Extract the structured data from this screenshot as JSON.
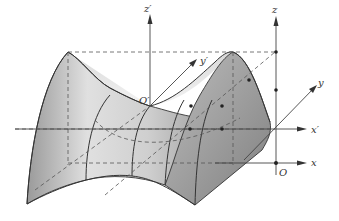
{
  "diagram": {
    "type": "saddle-surface-coordinate-translation",
    "labels": {
      "z_prime": "z′",
      "y_prime": "y′",
      "x_prime": "x′",
      "o_prime": "O′",
      "z": "z",
      "y": "y",
      "x": "x",
      "o": "O"
    },
    "colors": {
      "surface_light": "#f2f2f2",
      "surface_dark": "#8a8a8a",
      "edge": "#333333",
      "axis": "#444444",
      "dashed": "#555555"
    }
  }
}
